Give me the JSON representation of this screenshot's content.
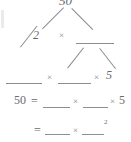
{
  "document": {
    "kind": "math-worksheet-factor-tree",
    "subject": "prime factorization of 50",
    "ink_color": "#6e6e72",
    "paper_color": "#ffffff",
    "blank_line_color": "#8d8d96"
  },
  "tree": {
    "root": {
      "label": "50",
      "clipped_at_top": true
    },
    "level2": {
      "left_label": "2",
      "operator": "×",
      "right_label": ""
    },
    "level3": {
      "left_label": "",
      "operator_1": "×",
      "middle_label": "",
      "operator_2": "×",
      "right_label": "5"
    }
  },
  "equations": [
    {
      "id": "line-1",
      "lhs": "50",
      "equals": "=",
      "term_1": "",
      "op_1": "×",
      "term_2": "",
      "op_2": "×",
      "term_3": "5",
      "exponent": ""
    },
    {
      "id": "line-2",
      "lhs": "",
      "equals": "=",
      "term_1": "",
      "op_1": "×",
      "term_2": "",
      "exponent": "2"
    }
  ]
}
